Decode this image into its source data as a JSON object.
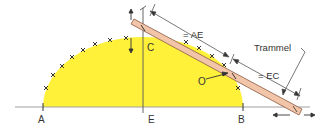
{
  "diagram": {
    "type": "trammel-method-ellipse-construction",
    "colors": {
      "ellipse_fill": "#fff13a",
      "trammel_fill": "#f2c4a8",
      "trammel_stroke": "#8a5a44",
      "line": "#555555",
      "axis": "#999999",
      "text": "#333333"
    },
    "points": {
      "A": "A",
      "E": "E",
      "B": "B",
      "C": "C",
      "O": "O"
    },
    "annotations": {
      "ae": "= AE",
      "ec": "= EC",
      "trammel": "Trammel"
    }
  }
}
